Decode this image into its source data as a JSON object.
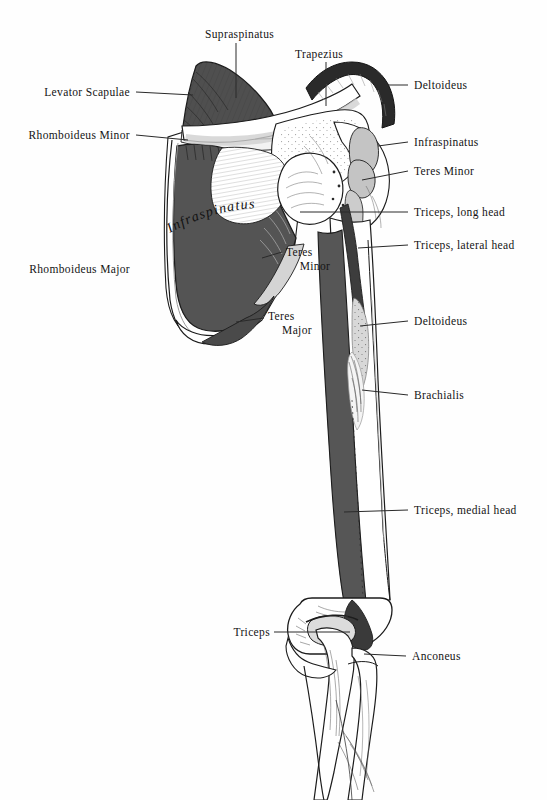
{
  "figure": {
    "background_color": "#fefefe",
    "ink_color": "#141414",
    "fills": {
      "dark_muscle": "#555555",
      "mid_muscle": "#7d7d7d",
      "light_muscle": "#c9c9c9",
      "bone": "#ffffff",
      "bone_shadow": "#e8e8e8",
      "near_black": "#1c1c1c"
    }
  },
  "labels": {
    "supraspinatus": "Supraspinatus",
    "trapezius": "Trapezius",
    "deltoideus_top": "Deltoideus",
    "levator_scapulae": "Levator Scapulae",
    "rhomboideus_minor": "Rhomboideus Minor",
    "infraspinatus_right": "Infraspinatus",
    "teres_minor_right": "Teres Minor",
    "triceps_long_head": "Triceps, long head",
    "triceps_lateral_head": "Triceps, lateral head",
    "rhomboideus_major": "Rhomboideus Major",
    "teres_minor_inner_l1": "Teres",
    "teres_minor_inner_l2": "Minor",
    "teres_major_inner_l1": "Teres",
    "teres_major_inner_l2": "Major",
    "deltoideus_mid": "Deltoideus",
    "brachialis": "Brachialis",
    "triceps_medial_head": "Triceps, medial head",
    "triceps_bottom": "Triceps",
    "anconeus": "Anconeus",
    "infraspinatus_onplate": "Infraspinatus"
  },
  "label_positions": [
    {
      "name": "supraspinatus",
      "x": 205,
      "y": 28,
      "align": "left",
      "leader": "vertical-down"
    },
    {
      "name": "trapezius",
      "x": 295,
      "y": 48,
      "align": "left",
      "leader": "vertical-down"
    },
    {
      "name": "deltoideus-top",
      "x": 414,
      "y": 80,
      "align": "left",
      "leader": "horizontal-left"
    },
    {
      "name": "levator-scapulae",
      "x": 130,
      "y": 88,
      "align": "right",
      "leader": "horizontal-right"
    },
    {
      "name": "rhomboideus-minor",
      "x": 130,
      "y": 131,
      "align": "right",
      "leader": "horizontal-right"
    },
    {
      "name": "infraspinatus-right",
      "x": 414,
      "y": 137,
      "align": "left",
      "leader": "horizontal-left"
    },
    {
      "name": "teres-minor-right",
      "x": 414,
      "y": 166,
      "align": "left",
      "leader": "horizontal-left"
    },
    {
      "name": "triceps-long-head",
      "x": 414,
      "y": 207,
      "align": "left",
      "leader": "horizontal-left"
    },
    {
      "name": "triceps-lateral-head",
      "x": 414,
      "y": 240,
      "align": "left",
      "leader": "horizontal-left"
    },
    {
      "name": "rhomboideus-major",
      "x": 130,
      "y": 265,
      "align": "right",
      "leader": "horizontal-right"
    },
    {
      "name": "teres-minor-inner",
      "x": 286,
      "y": 248,
      "align": "left",
      "leader": "horizontal-left"
    },
    {
      "name": "teres-major-inner",
      "x": 268,
      "y": 312,
      "align": "left",
      "leader": "horizontal-left"
    },
    {
      "name": "deltoideus-mid",
      "x": 414,
      "y": 316,
      "align": "left",
      "leader": "horizontal-left"
    },
    {
      "name": "brachialis",
      "x": 414,
      "y": 390,
      "align": "left",
      "leader": "horizontal-left"
    },
    {
      "name": "triceps-medial-head",
      "x": 414,
      "y": 505,
      "align": "left",
      "leader": "horizontal-left"
    },
    {
      "name": "triceps-bottom",
      "x": 270,
      "y": 628,
      "align": "right",
      "leader": "horizontal-right"
    },
    {
      "name": "anconeus",
      "x": 412,
      "y": 652,
      "align": "left",
      "leader": "horizontal-left"
    }
  ]
}
